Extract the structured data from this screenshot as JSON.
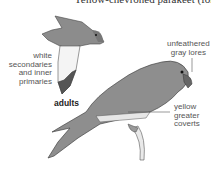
{
  "figure": {
    "title": "Yellow-chevroned parakeet (formerly)",
    "group_label": "adults",
    "annotations": [
      {
        "id": "wing",
        "text_lines": [
          "white",
          "secondaries",
          "and inner",
          "primaries"
        ]
      },
      {
        "id": "lores",
        "text_lines": [
          "unfeathered",
          "gray lores"
        ]
      },
      {
        "id": "coverts",
        "text_lines": [
          "yellow",
          "greater",
          "coverts"
        ]
      }
    ],
    "illustrations": [
      "flying-parakeet",
      "perched-parakeet"
    ],
    "colors": {
      "bird_body": "#8a8a8a",
      "bird_light": "#d9d9d9",
      "text": "#555555"
    }
  }
}
